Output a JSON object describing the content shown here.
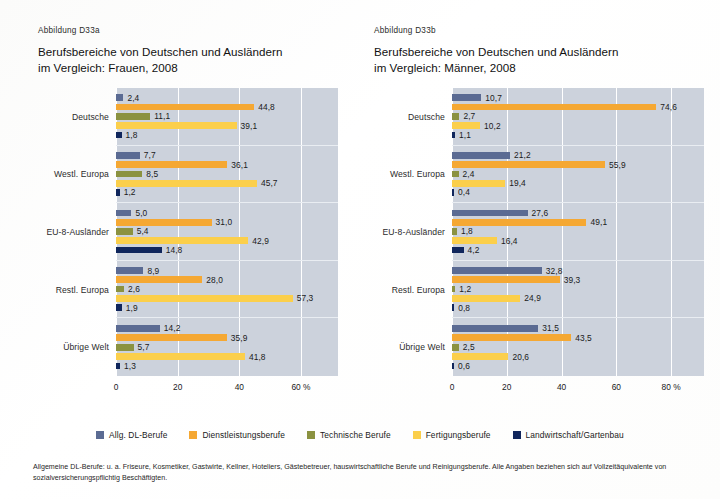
{
  "colors": {
    "series": [
      "#5b6b93",
      "#f5a833",
      "#8b9240",
      "#fbcf4b",
      "#10265c"
    ],
    "plot_background": "#ccd2dc",
    "gridline": "#ffffff",
    "page_background": "#ffffff"
  },
  "legend": {
    "items": [
      {
        "label": "Allg. DL-Berufe",
        "color": "#5b6b93"
      },
      {
        "label": "Dienstleistungsberufe",
        "color": "#f5a833"
      },
      {
        "label": "Technische Berufe",
        "color": "#8b9240"
      },
      {
        "label": "Fertigungsberufe",
        "color": "#fbcf4b"
      },
      {
        "label": "Landwirtschaft/Gartenbau",
        "color": "#10265c"
      }
    ]
  },
  "footnote": {
    "text": "Allgemeine DL-Berufe: u. a. Friseure, Kosmetiker, Gastwirte, Kellner, Hoteliers, Gästebetreuer, hauswirtschaftliche Berufe und Reinigungsberufe. Alle Angaben beziehen sich auf Vollzeitäquivalente von sozialversicherungspflichtig Beschäftigten."
  },
  "panels": {
    "left": {
      "fig_label": "Abbildung D33a",
      "title": "Berufsbereiche von Deutschen und Ausländern\nim Vergleich: Frauen, 2008"
    },
    "right": {
      "fig_label": "Abbildung D33b",
      "title": "Berufsbereiche von Deutschen und Ausländern\nim Vergleich: Männer, 2008"
    }
  },
  "chart_data": [
    {
      "id": "d33a",
      "type": "bar",
      "orientation": "horizontal",
      "title": "Berufsbereiche von Deutschen und Ausländern im Vergleich: Frauen, 2008",
      "figure_label": "Abbildung D33a",
      "xlabel": "%",
      "ylabel": "",
      "xlim": [
        0,
        72
      ],
      "xticks": [
        0,
        20,
        40,
        60
      ],
      "xtick_labels": [
        "0",
        "20",
        "40",
        "60 %"
      ],
      "grid": true,
      "legend_position": "bottom-shared",
      "categories": [
        "Deutsche",
        "Westl. Europa",
        "EU-8-Ausländer",
        "Restl. Europa",
        "Übrige Welt"
      ],
      "series": [
        {
          "name": "Allg. DL-Berufe",
          "color": "#5b6b93",
          "values": [
            2.4,
            7.7,
            5.0,
            8.9,
            14.2
          ],
          "labels": [
            "2,4",
            "7,7",
            "5,0",
            "8,9",
            "14,2"
          ]
        },
        {
          "name": "Dienstleistungsberufe",
          "color": "#f5a833",
          "values": [
            44.8,
            36.1,
            31.0,
            28.0,
            35.9
          ],
          "labels": [
            "44,8",
            "36,1",
            "31,0",
            "28,0",
            "35,9"
          ]
        },
        {
          "name": "Technische Berufe",
          "color": "#8b9240",
          "values": [
            11.1,
            8.5,
            5.4,
            2.6,
            5.7
          ],
          "labels": [
            "11,1",
            "8,5",
            "5,4",
            "2,6",
            "5,7"
          ]
        },
        {
          "name": "Fertigungsberufe",
          "color": "#fbcf4b",
          "values": [
            39.1,
            45.7,
            42.9,
            57.3,
            41.8
          ],
          "labels": [
            "39,1",
            "45,7",
            "42,9",
            "57,3",
            "41,8"
          ]
        },
        {
          "name": "Landwirtschaft/Gartenbau",
          "color": "#10265c",
          "values": [
            1.8,
            1.2,
            14.8,
            1.9,
            1.3
          ],
          "labels": [
            "1,8",
            "1,2",
            "14,8",
            "1,9",
            "1,3"
          ]
        }
      ]
    },
    {
      "id": "d33b",
      "type": "bar",
      "orientation": "horizontal",
      "title": "Berufsbereiche von Deutschen und Ausländern im Vergleich: Männer, 2008",
      "figure_label": "Abbildung D33b",
      "xlabel": "%",
      "ylabel": "",
      "xlim": [
        0,
        92
      ],
      "xticks": [
        0,
        20,
        40,
        60,
        80
      ],
      "xtick_labels": [
        "0",
        "20",
        "40",
        "60",
        "80 %"
      ],
      "grid": true,
      "legend_position": "bottom-shared",
      "categories": [
        "Deutsche",
        "Westl. Europa",
        "EU-8-Ausländer",
        "Restl. Europa",
        "Übrige Welt"
      ],
      "series": [
        {
          "name": "Allg. DL-Berufe",
          "color": "#5b6b93",
          "values": [
            10.7,
            21.2,
            27.6,
            32.8,
            31.5
          ],
          "labels": [
            "10,7",
            "21,2",
            "27,6",
            "32,8",
            "31,5"
          ]
        },
        {
          "name": "Dienstleistungsberufe",
          "color": "#f5a833",
          "values": [
            74.6,
            55.9,
            49.1,
            39.3,
            43.5
          ],
          "labels": [
            "74,6",
            "55,9",
            "49,1",
            "39,3",
            "43,5"
          ]
        },
        {
          "name": "Technische Berufe",
          "color": "#8b9240",
          "values": [
            2.7,
            2.4,
            1.8,
            1.2,
            2.5
          ],
          "labels": [
            "2,7",
            "2,4",
            "1,8",
            "1,2",
            "2,5"
          ]
        },
        {
          "name": "Fertigungsberufe",
          "color": "#fbcf4b",
          "values": [
            10.2,
            19.4,
            16.4,
            24.9,
            20.6
          ],
          "labels": [
            "10,2",
            "19,4",
            "16,4",
            "24,9",
            "20,6"
          ]
        },
        {
          "name": "Landwirtschaft/Gartenbau",
          "color": "#10265c",
          "values": [
            1.1,
            0.4,
            4.2,
            0.8,
            0.6
          ],
          "labels": [
            "1,1",
            "0,4",
            "4,2",
            "0,8",
            "0,6"
          ]
        }
      ]
    }
  ]
}
